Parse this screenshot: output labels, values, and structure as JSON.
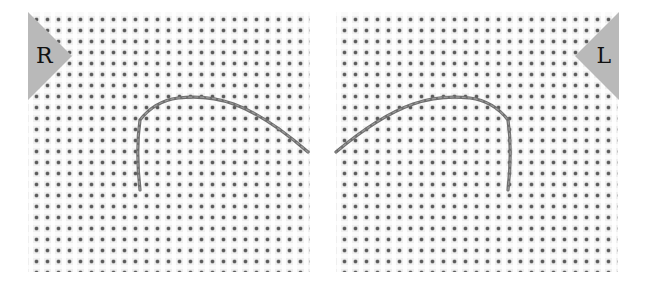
{
  "image": {
    "description": "Two side-by-side photos of aida cross-stitch fabric with a grey thread arching over the weave, mirrored left/right",
    "panels": [
      {
        "id": "left",
        "marker_label": "R"
      },
      {
        "id": "right",
        "marker_label": "L"
      }
    ],
    "colors": {
      "fabric": "#efefef",
      "fabric_holes": "#5a5a5a",
      "thread": "#6e6e6e",
      "marker": "#b9b9b9",
      "background": "#ffffff"
    }
  }
}
